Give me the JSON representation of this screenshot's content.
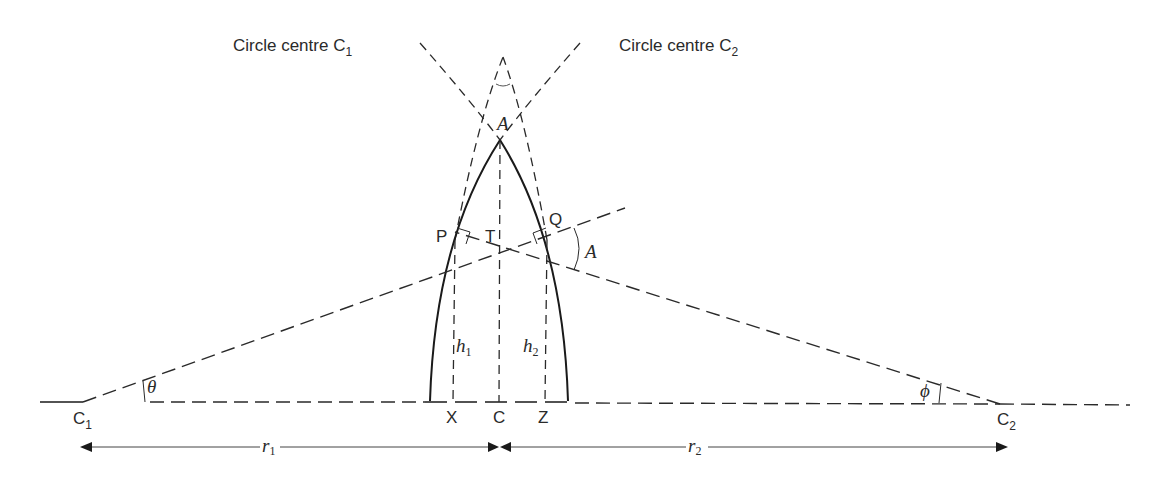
{
  "diagram": {
    "labels": {
      "circle1": "Circle centre C",
      "circle1_sub": "1",
      "circle2": "Circle centre C",
      "circle2_sub": "2",
      "apex_angle": "A",
      "side_angle": "A",
      "P": "P",
      "Q": "Q",
      "T": "T",
      "h1": "h",
      "h1_sub": "1",
      "h2": "h",
      "h2_sub": "2",
      "X": "X",
      "C": "C",
      "Z": "Z",
      "C1": "C",
      "C1_sub": "1",
      "C2": "C",
      "C2_sub": "2",
      "theta": "θ",
      "phi": "ϕ",
      "r1": "r",
      "r1_sub": "1",
      "r2": "r",
      "r2_sub": "2"
    },
    "points": {
      "C1": [
        83,
        402
      ],
      "C2": [
        1000,
        404
      ],
      "apex": [
        500,
        140
      ],
      "P": [
        455,
        240
      ],
      "Q": [
        547,
        240
      ],
      "T": [
        501,
        250
      ],
      "X": [
        453,
        402
      ],
      "C": [
        499,
        402
      ],
      "Z": [
        545,
        402
      ]
    },
    "colors": {
      "ink": "#2a2a2a",
      "background": "#ffffff"
    }
  }
}
